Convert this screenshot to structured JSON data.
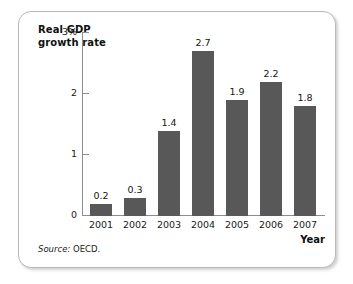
{
  "figure": {
    "source_label": "Source:",
    "source_value": "OECD.",
    "frame_color": "#b9b9b9",
    "bar_color": "#585858",
    "axis_color": "#8d8d8d",
    "background": "#ffffff"
  },
  "chart_data": {
    "type": "bar",
    "title": "",
    "ylabel": "Real GDP growth rate",
    "xlabel": "Year",
    "categories": [
      "2001",
      "2002",
      "2003",
      "2004",
      "2005",
      "2006",
      "2007"
    ],
    "values": [
      0.2,
      0.3,
      1.4,
      2.7,
      1.9,
      2.2,
      1.8
    ],
    "value_labels": [
      "0.2",
      "0.3",
      "1.4",
      "2.7",
      "1.9",
      "2.2",
      "1.8"
    ],
    "ylim": [
      0,
      3
    ],
    "yticks": [
      0,
      1,
      2,
      3
    ],
    "ytick_labels": [
      "0",
      "1",
      "2",
      "3%"
    ],
    "grid": false,
    "legend": null,
    "series": [
      {
        "name": "Real GDP growth rate",
        "values": [
          0.2,
          0.3,
          1.4,
          2.7,
          1.9,
          2.2,
          1.8
        ]
      }
    ]
  }
}
